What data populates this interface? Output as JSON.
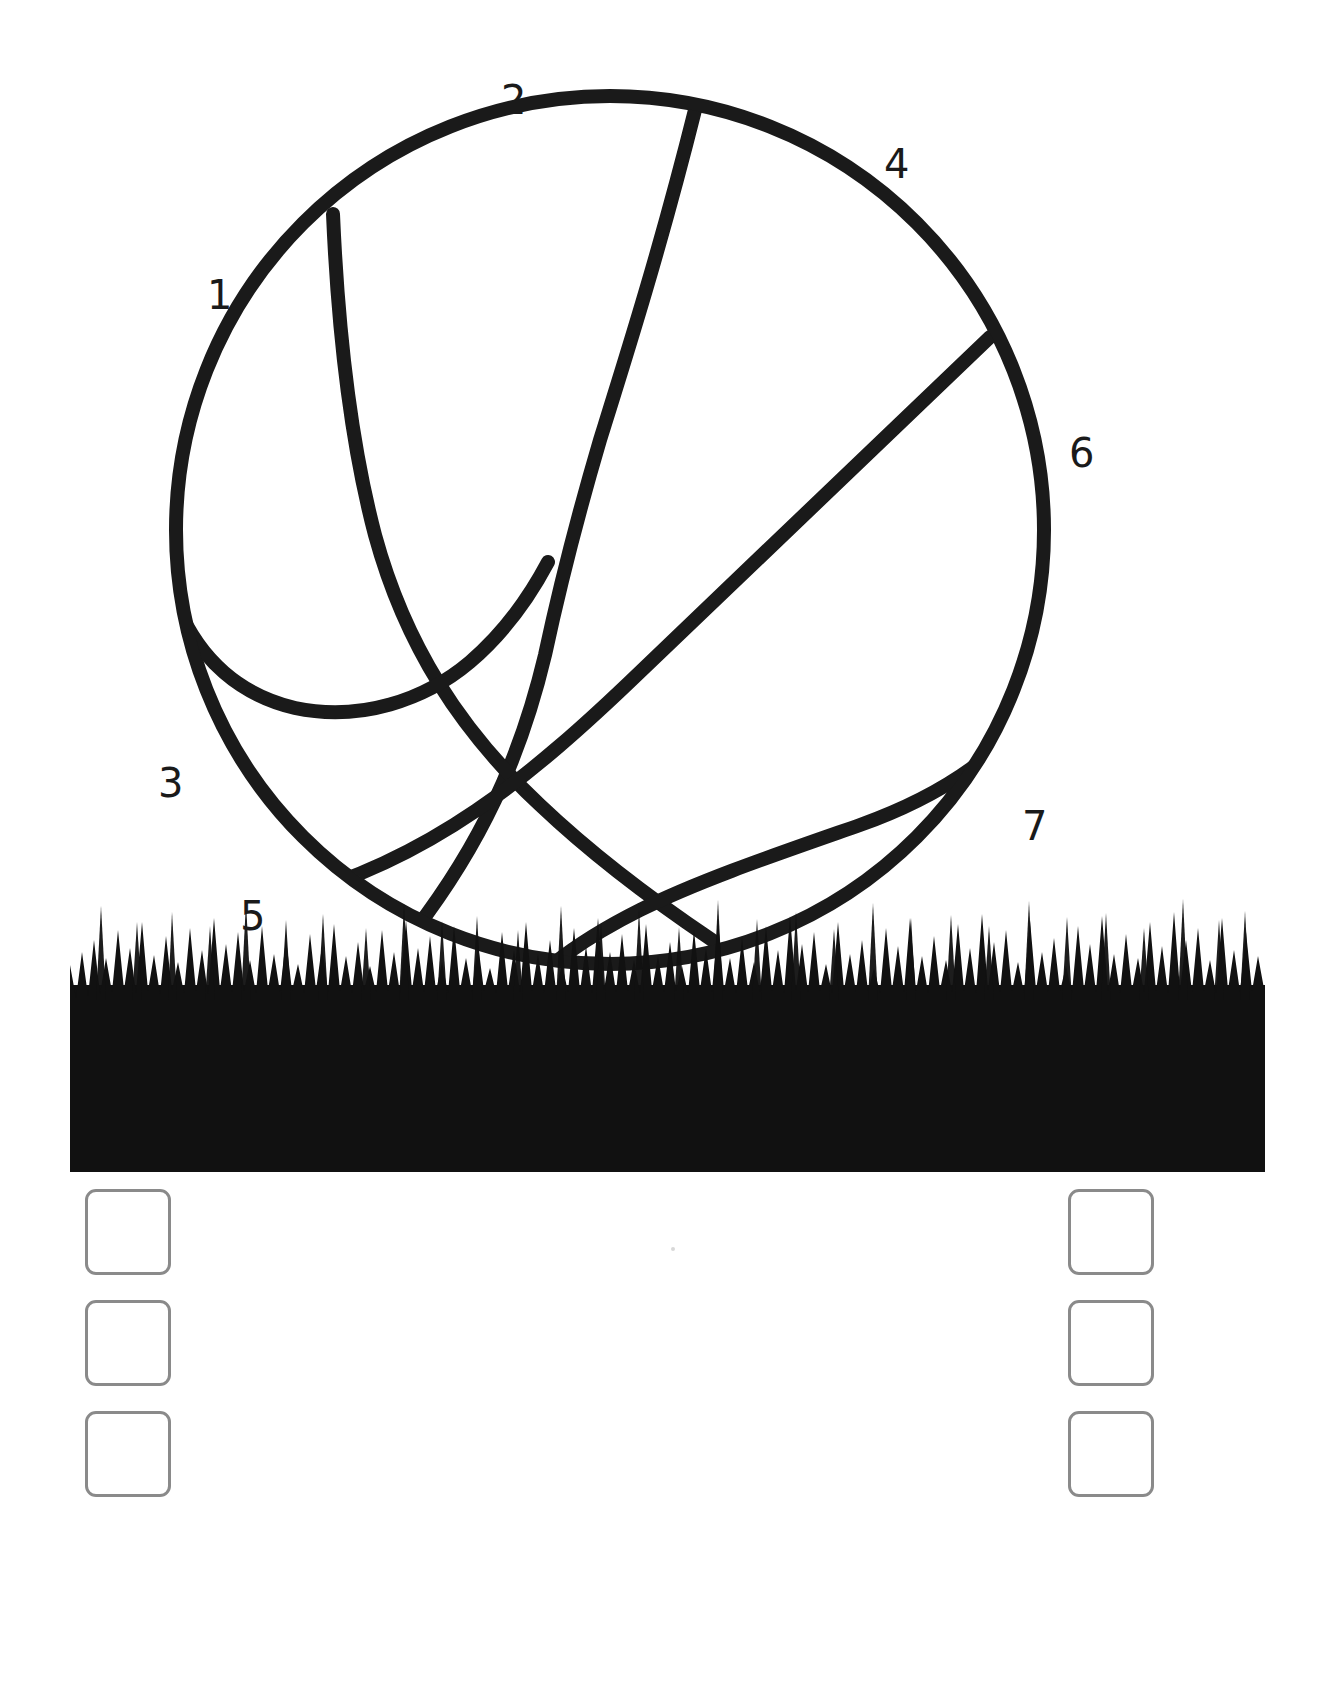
{
  "page": {
    "kind": "coloring-worksheet",
    "background_color": "#ffffff",
    "ink_color": "#1a1a1a",
    "width": 1330,
    "height": 1689
  },
  "illustration": {
    "ball": {
      "name": "basketball-outline",
      "center_x": 610,
      "center_y": 530,
      "radius": 434,
      "stroke_color": "#1a1a1a",
      "stroke_width": 14,
      "fill": "none"
    },
    "ground": {
      "name": "grass-band",
      "left": 70,
      "right": 1265,
      "top": 905,
      "bottom": 1172,
      "color": "#111111"
    }
  },
  "region_labels": [
    {
      "id": 1,
      "text": "1",
      "x": 207,
      "y": 275
    },
    {
      "id": 2,
      "text": "2",
      "x": 501,
      "y": 80
    },
    {
      "id": 3,
      "text": "3",
      "x": 158,
      "y": 763
    },
    {
      "id": 4,
      "text": "4",
      "x": 884,
      "y": 144
    },
    {
      "id": 5,
      "text": "5",
      "x": 240,
      "y": 896
    },
    {
      "id": 6,
      "text": "6",
      "x": 1069,
      "y": 433
    },
    {
      "id": 7,
      "text": "7",
      "x": 1022,
      "y": 806
    }
  ],
  "color_swatches": {
    "border_color": "#8a8a8a",
    "fill_color": "#ffffff",
    "size": 86,
    "left_column": [
      {
        "name": "swatch-left-1",
        "x": 85,
        "y": 1189,
        "value": ""
      },
      {
        "name": "swatch-left-2",
        "x": 85,
        "y": 1300,
        "value": ""
      },
      {
        "name": "swatch-left-3",
        "x": 85,
        "y": 1411,
        "value": ""
      }
    ],
    "right_column": [
      {
        "name": "swatch-right-1",
        "x": 1068,
        "y": 1189,
        "value": ""
      },
      {
        "name": "swatch-right-2",
        "x": 1068,
        "y": 1300,
        "value": ""
      },
      {
        "name": "swatch-right-3",
        "x": 1068,
        "y": 1411,
        "value": ""
      }
    ]
  },
  "marks": [
    {
      "name": "page-speck",
      "x": 671,
      "y": 1247
    }
  ]
}
